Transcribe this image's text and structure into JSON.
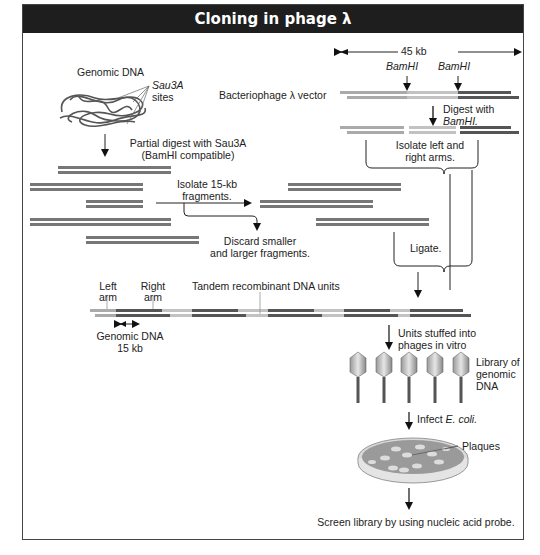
{
  "title": "Cloning in phage λ",
  "vector": {
    "size_label": "45 kb",
    "site_label_1": "BamHI",
    "site_label_2": "BamHI",
    "vector_label": "Bacteriophage λ vector",
    "digest_label_1": "Digest with",
    "digest_label_2": "BamHI.",
    "isolate_arms_1": "Isolate left and",
    "isolate_arms_2": "right arms."
  },
  "genomic": {
    "label": "Genomic DNA",
    "sites_1": "Sau3A",
    "sites_2": "sites",
    "partial_1": "Partial digest with Sau3A",
    "partial_2": "(BamHI compatible)",
    "isolate_1": "Isolate 15-kb",
    "isolate_2": "fragments.",
    "discard_1": "Discard smaller",
    "discard_2": "and larger fragments."
  },
  "ligate": "Ligate.",
  "concatemer": {
    "left_arm_1": "Left",
    "left_arm_2": "arm",
    "right_arm_1": "Right",
    "right_arm_2": "arm",
    "tandem": "Tandem recombinant DNA units",
    "genomic_1": "Genomic DNA",
    "genomic_2": "15 kb"
  },
  "packaging": {
    "stuffed_1": "Units stuffed into",
    "stuffed_2": "phages in vitro",
    "library_1": "Library of",
    "library_2": "genomic",
    "library_3": "DNA",
    "phage_count": 5
  },
  "infect": {
    "prefix": "Infect ",
    "organism": "E. coli."
  },
  "plaques": "Plaques",
  "screen": "Screen library by using nucleic acid probe.",
  "colors": {
    "title_bg": "#1e1e1e",
    "arm_light": "#a8a8a8",
    "arm_mid": "#c4c4c4",
    "arm_dark": "#555555",
    "genomic": "#777777",
    "plate": "#9a9a9a"
  }
}
